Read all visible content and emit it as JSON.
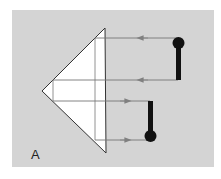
{
  "figure": {
    "label": "A",
    "background_color": "#d4d4d4",
    "prism_fill": "#ffffff",
    "ray_color": "#777777",
    "stem_color": "#111111"
  },
  "prism": {
    "apex": [
      42,
      91
    ],
    "top": [
      105,
      28
    ],
    "bottom": [
      106,
      153
    ]
  },
  "rays": [
    {
      "y": 38,
      "direction": "left",
      "from_x": 178,
      "to_x": 95
    },
    {
      "y": 80,
      "direction": "left",
      "from_x": 178,
      "to_x": 53
    },
    {
      "y": 101,
      "direction": "right",
      "from_x": 53,
      "to_x": 150
    },
    {
      "y": 140,
      "direction": "right",
      "from_x": 95,
      "to_x": 150
    }
  ],
  "objects": [
    {
      "name": "upright-object",
      "ball_y": 43,
      "stem_top": 43,
      "stem_bottom": 80,
      "x": 179
    },
    {
      "name": "inverted-image",
      "ball_y": 136,
      "stem_top": 101,
      "stem_bottom": 136,
      "x": 151
    }
  ]
}
